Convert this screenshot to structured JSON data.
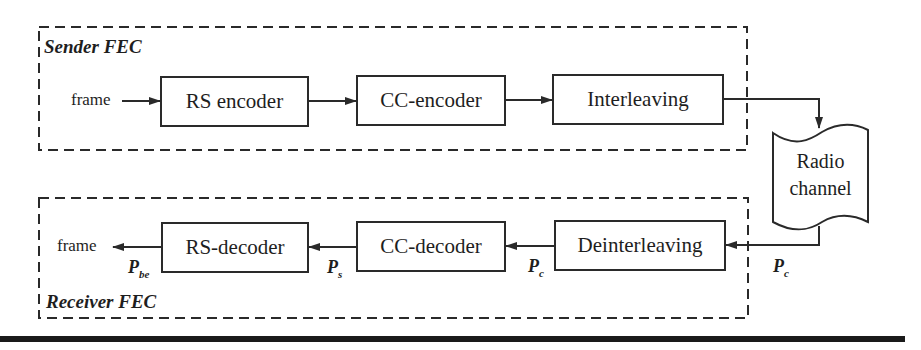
{
  "sender": {
    "title": "Sender FEC",
    "input_label": "frame",
    "blocks": [
      {
        "label": "RS encoder"
      },
      {
        "label": "CC-encoder"
      },
      {
        "label": "Interleaving"
      }
    ]
  },
  "channel": {
    "line1": "Radio",
    "line2": "channel"
  },
  "receiver": {
    "title": "Receiver FEC",
    "output_label": "frame",
    "blocks": [
      {
        "label": "RS-decoder"
      },
      {
        "label": "CC-decoder"
      },
      {
        "label": "Deinterleaving"
      }
    ],
    "probabilities": [
      {
        "symbol": "P",
        "sub": "be"
      },
      {
        "symbol": "P",
        "sub": "s"
      },
      {
        "symbol": "P",
        "sub": "c"
      },
      {
        "symbol": "P",
        "sub": "c"
      }
    ]
  },
  "colors": {
    "stroke": "#2a2a2a",
    "background": "#ffffff"
  }
}
